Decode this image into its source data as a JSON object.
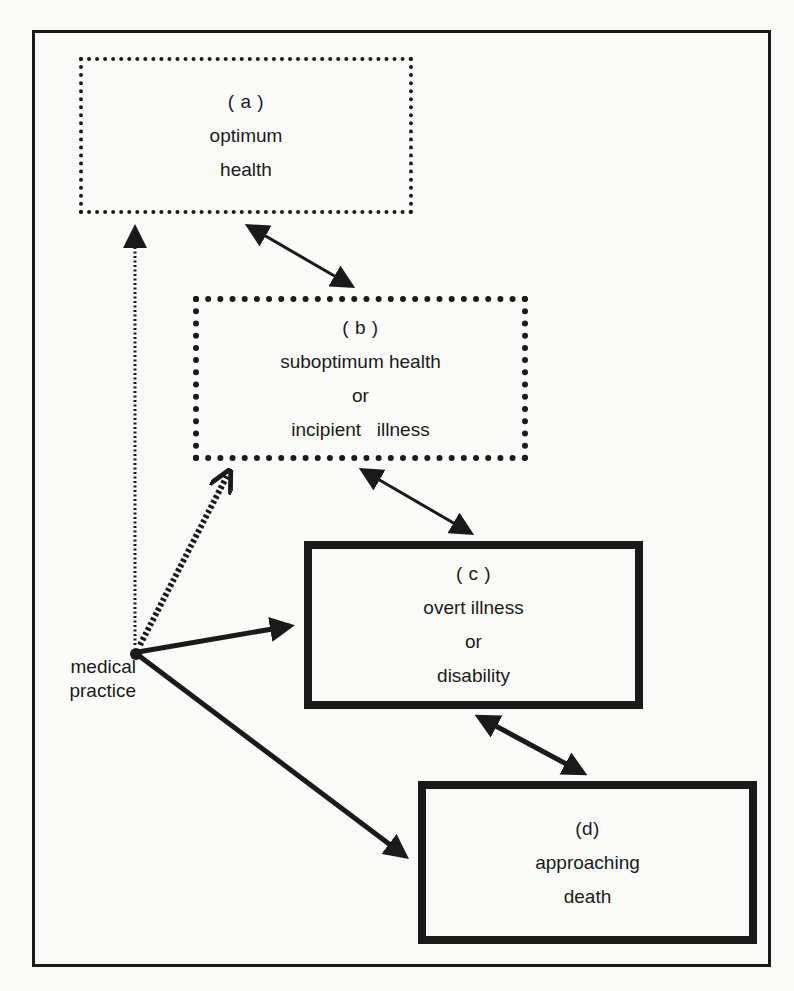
{
  "diagram": {
    "boxes": {
      "a": {
        "tag": "( a )",
        "lines": [
          "optimum",
          "health"
        ],
        "style": "fine-dotted"
      },
      "b": {
        "tag": "( b )",
        "lines": [
          "suboptimum health",
          "or",
          "incipient   illness"
        ],
        "style": "heavy-dotted"
      },
      "c": {
        "tag": "( c )",
        "lines": [
          "overt illness",
          "or",
          "disability"
        ],
        "style": "solid"
      },
      "d": {
        "tag": "(d)",
        "lines": [
          "approaching",
          "death"
        ],
        "style": "solid"
      }
    },
    "origin": {
      "lines": [
        "medical",
        "practice"
      ]
    },
    "edges": [
      {
        "from": "a",
        "to": "b",
        "type": "bidirectional"
      },
      {
        "from": "b",
        "to": "c",
        "type": "bidirectional"
      },
      {
        "from": "c",
        "to": "d",
        "type": "bidirectional"
      },
      {
        "from": "medical practice",
        "to": "a",
        "type": "fine-dotted arrow"
      },
      {
        "from": "medical practice",
        "to": "b",
        "type": "heavy-dotted arrow"
      },
      {
        "from": "medical practice",
        "to": "c",
        "type": "solid arrow"
      },
      {
        "from": "medical practice",
        "to": "d",
        "type": "solid arrow"
      }
    ]
  }
}
